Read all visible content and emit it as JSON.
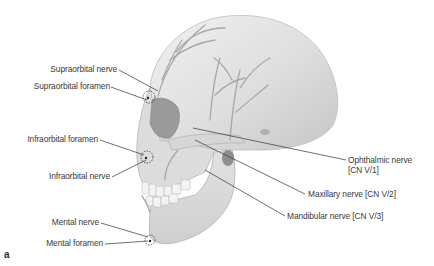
{
  "figure": {
    "panel_letter": "a",
    "labels_left": [
      {
        "text": "Supraorbital nerve"
      },
      {
        "text": "Supraorbital foramen"
      },
      {
        "text": "Infraorbital foramen"
      },
      {
        "text": "Infraorbital nerve"
      },
      {
        "text": "Mental nerve"
      },
      {
        "text": "Mental foramen"
      }
    ],
    "labels_right": [
      {
        "text": "Ophthalmic nerve",
        "text2": "[CN V/1]"
      },
      {
        "text": "Maxillary nerve [CN V/2]"
      },
      {
        "text": "Mandibular nerve [CN V/3]"
      }
    ],
    "colors": {
      "bone": "#e4e4e4",
      "bone_shadow": "#b9b9b9",
      "nerve": "#a8a8a8",
      "leader": "#333333",
      "text": "#3a3a3a"
    }
  }
}
